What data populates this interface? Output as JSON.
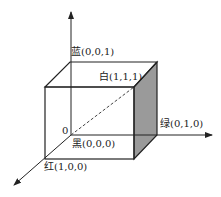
{
  "diagram": {
    "type": "rgb-color-cube",
    "origin_label": "0",
    "vertices": {
      "blue": "蓝(0,0,1)",
      "white": "白(1,1,1)",
      "green": "绿(0,1,0)",
      "black": "黑(0,0,0)",
      "red": "红(1,0,0)"
    },
    "colors": {
      "line": "#222222",
      "shaded_face": "#9a9a9a",
      "background": "#ffffff"
    }
  }
}
